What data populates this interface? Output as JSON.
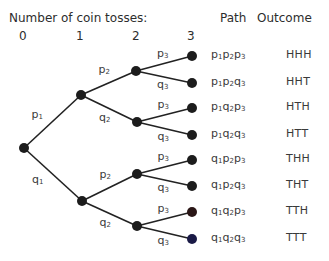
{
  "header": {
    "title": "Number of coin tosses:",
    "path_col": "Path",
    "outcome_col": "Outcome",
    "levels": [
      "0",
      "1",
      "2",
      "3"
    ]
  },
  "colors": {
    "line": "#222222",
    "node": "#1c1c1c",
    "leaf_tth": "#2a1616",
    "leaf_ttt": "#1a1a46",
    "text": "#333333"
  },
  "tree": {
    "root": {
      "x": 24,
      "y": 148
    },
    "level1": [
      {
        "x": 81,
        "y": 95,
        "edge_label": "p",
        "edge_sub": "1"
      },
      {
        "x": 82,
        "y": 201,
        "edge_label": "q",
        "edge_sub": "1"
      }
    ],
    "level2": [
      {
        "x": 136,
        "y": 71,
        "parent": 0,
        "edge_label": "p",
        "edge_sub": "2"
      },
      {
        "x": 137,
        "y": 122,
        "parent": 0,
        "edge_label": "q",
        "edge_sub": "2"
      },
      {
        "x": 137,
        "y": 174,
        "parent": 1,
        "edge_label": "p",
        "edge_sub": "2"
      },
      {
        "x": 137,
        "y": 226,
        "parent": 1,
        "edge_label": "q",
        "edge_sub": "2"
      }
    ],
    "leaves": [
      {
        "x": 192,
        "y": 56,
        "parent": 0,
        "edge_label": "p",
        "edge_sub": "3",
        "path": [
          "p",
          "1",
          "p",
          "2",
          "p",
          "3"
        ],
        "outcome": "HHH"
      },
      {
        "x": 192,
        "y": 83,
        "parent": 0,
        "edge_label": "q",
        "edge_sub": "3",
        "path": [
          "p",
          "1",
          "p",
          "2",
          "q",
          "3"
        ],
        "outcome": "HHT"
      },
      {
        "x": 192,
        "y": 108,
        "parent": 1,
        "edge_label": "p",
        "edge_sub": "3",
        "path": [
          "p",
          "1",
          "q",
          "2",
          "p",
          "3"
        ],
        "outcome": "HTH"
      },
      {
        "x": 192,
        "y": 135,
        "parent": 1,
        "edge_label": "q",
        "edge_sub": "3",
        "path": [
          "p",
          "1",
          "q",
          "2",
          "q",
          "3"
        ],
        "outcome": "HTT"
      },
      {
        "x": 192,
        "y": 160,
        "parent": 2,
        "edge_label": "p",
        "edge_sub": "3",
        "path": [
          "q",
          "1",
          "p",
          "2",
          "p",
          "3"
        ],
        "outcome": "THH"
      },
      {
        "x": 192,
        "y": 186,
        "parent": 2,
        "edge_label": "q",
        "edge_sub": "3",
        "path": [
          "q",
          "1",
          "p",
          "2",
          "q",
          "3"
        ],
        "outcome": "THT"
      },
      {
        "x": 192,
        "y": 212,
        "parent": 3,
        "edge_label": "p",
        "edge_sub": "3",
        "path": [
          "q",
          "1",
          "q",
          "2",
          "p",
          "3"
        ],
        "outcome": "TTH"
      },
      {
        "x": 192,
        "y": 239,
        "parent": 3,
        "edge_label": "q",
        "edge_sub": "3",
        "path": [
          "q",
          "1",
          "q",
          "2",
          "q",
          "3"
        ],
        "outcome": "TTT"
      }
    ]
  }
}
